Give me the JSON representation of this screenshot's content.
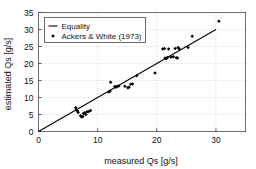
{
  "chart_data": {
    "type": "scatter",
    "title": "",
    "xlabel": "measured Qs [g/s]",
    "ylabel": "estimated Qs [g/s]",
    "xlim": [
      0,
      35
    ],
    "ylim": [
      0,
      35
    ],
    "xticks": [
      0,
      10,
      20,
      30
    ],
    "yticks": [
      0,
      5,
      10,
      15,
      20,
      25,
      30,
      35
    ],
    "xtick_labels": [
      "0",
      "10",
      "20",
      "30"
    ],
    "ytick_labels": [
      "0",
      "5",
      "10",
      "15",
      "20",
      "25",
      "30",
      "35"
    ],
    "x_minor_grid_step": 10,
    "y_minor_grid_step": 5,
    "grid": true,
    "grid_style": "dotted",
    "grid_color": "#c9c9c9",
    "legend_position": "top-left",
    "legend": [
      {
        "label": "Equality",
        "marker": "line",
        "color": "#000000"
      },
      {
        "label": "Ackers & White (1973)",
        "marker": "dot",
        "color": "#000000"
      }
    ],
    "series": [
      {
        "name": "Equality",
        "type": "line",
        "color": "#000000",
        "x": [
          0,
          30
        ],
        "y": [
          0,
          30
        ]
      },
      {
        "name": "Ackers & White (1973)",
        "type": "scatter",
        "marker": "diamond",
        "color": "#000000",
        "points": [
          [
            6.3,
            7.0
          ],
          [
            6.4,
            6.3
          ],
          [
            6.6,
            6.0
          ],
          [
            6.7,
            5.6
          ],
          [
            7.1,
            4.6
          ],
          [
            7.3,
            4.3
          ],
          [
            7.5,
            4.4
          ],
          [
            7.6,
            5.3
          ],
          [
            7.8,
            5.5
          ],
          [
            8.0,
            5.0
          ],
          [
            8.2,
            5.8
          ],
          [
            8.5,
            5.9
          ],
          [
            8.8,
            6.2
          ],
          [
            11.9,
            11.6
          ],
          [
            12.1,
            11.9
          ],
          [
            12.2,
            14.5
          ],
          [
            12.9,
            13.2
          ],
          [
            13.1,
            13.0
          ],
          [
            13.3,
            13.3
          ],
          [
            13.6,
            13.4
          ],
          [
            14.6,
            13.3
          ],
          [
            15.1,
            12.9
          ],
          [
            15.3,
            13.0
          ],
          [
            15.6,
            13.9
          ],
          [
            15.9,
            14.0
          ],
          [
            16.6,
            16.4
          ],
          [
            19.7,
            17.2
          ],
          [
            21.0,
            24.3
          ],
          [
            21.3,
            24.4
          ],
          [
            21.4,
            21.6
          ],
          [
            21.6,
            21.4
          ],
          [
            21.8,
            21.8
          ],
          [
            22.0,
            24.3
          ],
          [
            22.4,
            21.9
          ],
          [
            22.8,
            22.0
          ],
          [
            23.1,
            24.4
          ],
          [
            23.3,
            21.7
          ],
          [
            23.5,
            21.6
          ],
          [
            23.6,
            24.7
          ],
          [
            23.8,
            24.3
          ],
          [
            25.3,
            24.7
          ],
          [
            26.0,
            28.0
          ],
          [
            30.5,
            32.4
          ]
        ]
      }
    ]
  }
}
